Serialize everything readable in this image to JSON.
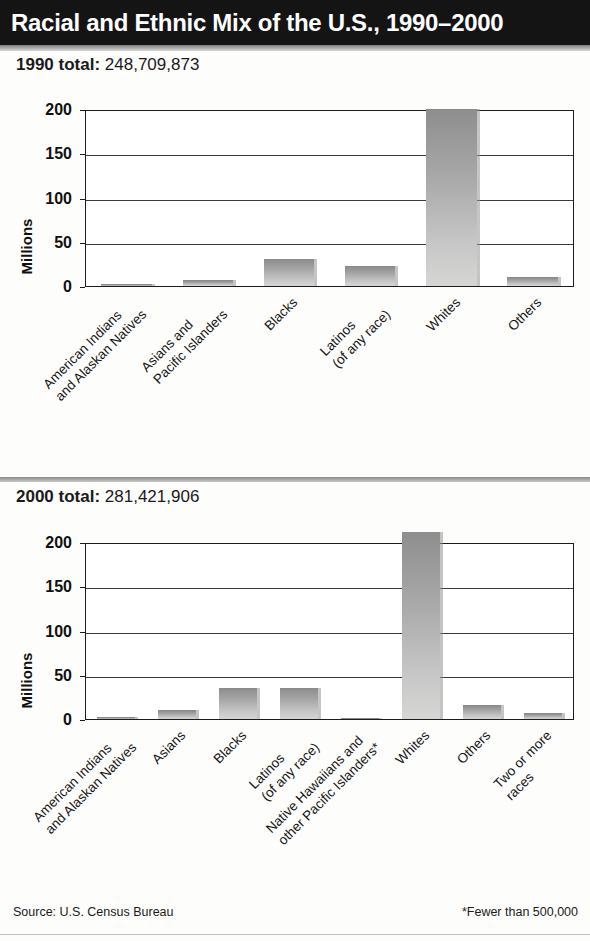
{
  "header": {
    "title": "Racial and Ethnic Mix of the U.S., 1990–2000"
  },
  "footer": {
    "source": "Source: U.S. Census Bureau",
    "note": "*Fewer than 500,000"
  },
  "panels": [
    {
      "total_label": "1990 total:",
      "total_value": "248,709,873"
    },
    {
      "total_label": "2000 total:",
      "total_value": "281,421,906"
    }
  ],
  "chart_data": [
    {
      "type": "bar",
      "title": "1990 total: 248,709,873",
      "xlabel": "",
      "ylabel": "Millions",
      "ylim": [
        0,
        200
      ],
      "yticks": [
        0,
        50,
        100,
        150,
        200
      ],
      "ytick_labels": [
        "0",
        "50",
        "100",
        "150",
        "200"
      ],
      "grid": true,
      "legend": false,
      "categories": [
        "American Indians\nand Alaskan Natives",
        "Asians and\nPacific Islanders",
        "Blacks",
        "Latinos\n(of any race)",
        "Whites",
        "Others"
      ],
      "values": [
        2,
        7.3,
        30,
        22.4,
        199.7,
        9.8
      ]
    },
    {
      "type": "bar",
      "title": "2000 total: 281,421,906",
      "xlabel": "",
      "ylabel": "Millions",
      "ylim": [
        0,
        200
      ],
      "yticks": [
        0,
        50,
        100,
        150,
        200
      ],
      "ytick_labels": [
        "0",
        "50",
        "100",
        "150",
        "200"
      ],
      "grid": true,
      "legend": false,
      "categories": [
        "American Indians\nand Alaskan Natives",
        "Asians",
        "Blacks",
        "Latinos\n(of any race)",
        "Native Hawaiians and\nother Pacific Islanders*",
        "Whites",
        "Others",
        "Two or more\nraces"
      ],
      "values": [
        2.5,
        10.2,
        34.7,
        35.3,
        0.4,
        211.5,
        15.4,
        6.8
      ]
    }
  ]
}
